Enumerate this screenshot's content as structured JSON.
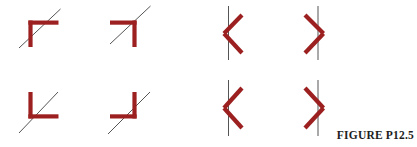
{
  "figure": {
    "caption": "FIGURE P12.5",
    "width": 417,
    "height": 147,
    "background_color": "#ffffff",
    "mirror_color": "#9c2020",
    "ray_color": "#555555",
    "caption_color": "#1d1d1d",
    "mirror_stroke_width": 4.2,
    "ray_stroke_width": 1.0,
    "panel_count": 8,
    "rows": 2,
    "columns": 4,
    "panels": [
      {
        "id": "panel-1",
        "row": 1,
        "column": 1,
        "mirror_shape": "corner-open-down-right",
        "mirror_description": "right-angle mirror, vertex upper-left, arms extend right and down",
        "ray_type": "diagonal",
        "ray_description": "diagonal line from lower-left to upper-right passing through the corner vertex",
        "mirror_segments": [
          {
            "x1": 30.5,
            "y1": 20.5,
            "x2": 30.5,
            "y2": 47.0
          },
          {
            "x1": 28.4,
            "y1": 22.6,
            "x2": 58.5,
            "y2": 22.6
          }
        ],
        "ray_segments": [
          {
            "x1": 19.0,
            "y1": 48.0,
            "x2": 60.5,
            "y2": 9.0
          }
        ]
      },
      {
        "id": "panel-2",
        "row": 1,
        "column": 2,
        "mirror_shape": "corner-open-down-left",
        "mirror_description": "right-angle mirror, vertex upper-right, arms extend left and down",
        "ray_type": "diagonal",
        "ray_description": "diagonal line from lower-left to upper-right passing through the corner vertex",
        "mirror_segments": [
          {
            "x1": 134.5,
            "y1": 20.5,
            "x2": 134.5,
            "y2": 47.0
          },
          {
            "x1": 136.6,
            "y1": 22.6,
            "x2": 110.0,
            "y2": 22.6
          }
        ],
        "ray_segments": [
          {
            "x1": 110.0,
            "y1": 44.0,
            "x2": 150.5,
            "y2": 6.0
          }
        ]
      },
      {
        "id": "panel-3",
        "row": 1,
        "column": 3,
        "mirror_shape": "chevron-left",
        "mirror_description": "V-shaped mirror opening to the right, vertex on the left",
        "ray_type": "vertical",
        "ray_description": "vertical line passing just right of the chevron vertex",
        "mirror_segments": [
          {
            "x1": 242.0,
            "y1": 15.0,
            "x2": 224.0,
            "y2": 33.5
          },
          {
            "x1": 224.0,
            "y1": 33.5,
            "x2": 242.0,
            "y2": 53.0
          }
        ],
        "ray_segments": [
          {
            "x1": 228.5,
            "y1": 6.0,
            "x2": 228.5,
            "y2": 60.0
          }
        ]
      },
      {
        "id": "panel-4",
        "row": 1,
        "column": 4,
        "mirror_shape": "chevron-right",
        "mirror_description": "V-shaped mirror opening to the left, vertex on the right",
        "ray_type": "vertical",
        "ray_description": "vertical line passing just left of the chevron vertex",
        "mirror_segments": [
          {
            "x1": 305.0,
            "y1": 15.0,
            "x2": 323.5,
            "y2": 33.5
          },
          {
            "x1": 323.5,
            "y1": 33.5,
            "x2": 305.0,
            "y2": 53.0
          }
        ],
        "ray_segments": [
          {
            "x1": 318.0,
            "y1": 6.0,
            "x2": 318.0,
            "y2": 60.0
          }
        ]
      },
      {
        "id": "panel-5",
        "row": 2,
        "column": 1,
        "mirror_shape": "corner-open-up-right",
        "mirror_description": "right-angle mirror, vertex lower-left, arms extend up and right",
        "ray_type": "diagonal",
        "ray_description": "diagonal line from lower-left to upper-right passing through the corner vertex",
        "mirror_segments": [
          {
            "x1": 30.5,
            "y1": 92.0,
            "x2": 30.5,
            "y2": 118.5
          },
          {
            "x1": 28.4,
            "y1": 116.4,
            "x2": 58.5,
            "y2": 116.4
          }
        ],
        "ray_segments": [
          {
            "x1": 19.0,
            "y1": 133.0,
            "x2": 58.0,
            "y2": 92.0
          }
        ]
      },
      {
        "id": "panel-6",
        "row": 2,
        "column": 2,
        "mirror_shape": "corner-open-up-left",
        "mirror_description": "right-angle mirror, vertex lower-right, arms extend up and left",
        "ray_type": "diagonal",
        "ray_description": "diagonal line from lower-left to upper-right passing through the corner vertex",
        "mirror_segments": [
          {
            "x1": 134.5,
            "y1": 92.0,
            "x2": 134.5,
            "y2": 118.5
          },
          {
            "x1": 136.6,
            "y1": 116.4,
            "x2": 110.0,
            "y2": 116.4
          }
        ],
        "ray_segments": [
          {
            "x1": 108.0,
            "y1": 134.0,
            "x2": 150.0,
            "y2": 92.0
          }
        ]
      },
      {
        "id": "panel-7",
        "row": 2,
        "column": 3,
        "mirror_shape": "chevron-left",
        "mirror_description": "V-shaped mirror opening to the right, vertex on the left",
        "ray_type": "vertical",
        "ray_description": "vertical line passing just right of the chevron vertex",
        "mirror_segments": [
          {
            "x1": 242.0,
            "y1": 88.0,
            "x2": 224.0,
            "y2": 108.0
          },
          {
            "x1": 224.0,
            "y1": 108.0,
            "x2": 242.0,
            "y2": 128.0
          }
        ],
        "ray_segments": [
          {
            "x1": 228.5,
            "y1": 80.0,
            "x2": 228.5,
            "y2": 136.0
          }
        ]
      },
      {
        "id": "panel-8",
        "row": 2,
        "column": 4,
        "mirror_shape": "chevron-right",
        "mirror_description": "V-shaped mirror opening to the left, vertex on the right",
        "ray_type": "vertical",
        "ray_description": "vertical line passing just left of the chevron vertex",
        "mirror_segments": [
          {
            "x1": 305.0,
            "y1": 88.0,
            "x2": 323.5,
            "y2": 108.0
          },
          {
            "x1": 323.5,
            "y1": 108.0,
            "x2": 305.0,
            "y2": 128.0
          }
        ],
        "ray_segments": [
          {
            "x1": 318.0,
            "y1": 80.0,
            "x2": 318.0,
            "y2": 136.0
          }
        ]
      }
    ]
  }
}
